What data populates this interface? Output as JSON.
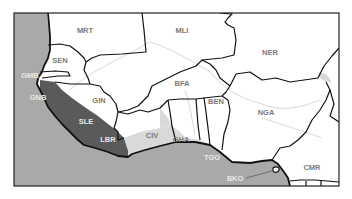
{
  "map": {
    "colors": {
      "ocean": "#a9a9a9",
      "land": "#ffffff",
      "high_risk": "#5a5a5a",
      "medium_risk": "#d9d9d9",
      "border": "#111111",
      "river": "#d4d4d4",
      "frame": "#222222"
    },
    "labels": {
      "MRT": "MRT",
      "MLI": "MLI",
      "NER": "NER",
      "SEN": "SEN",
      "GMB": "GMB",
      "GNB": "GNB",
      "GIN": "GIN",
      "SLE": "SLE",
      "LBR": "LBR",
      "CIV": "CIV",
      "BFA": "BFA",
      "GHA": "GHA",
      "TGO": "TGO",
      "BEN": "BEN",
      "NGA": "NGA",
      "CMR": "CMR",
      "BKO": "BKO"
    }
  }
}
